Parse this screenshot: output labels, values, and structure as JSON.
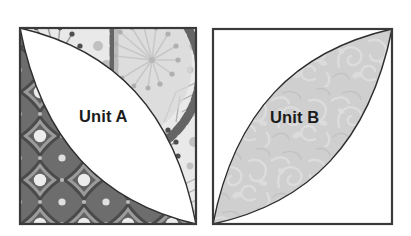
{
  "figure": {
    "type": "quilt-block-diagram",
    "background_color": "#ffffff",
    "panel_count": 2
  },
  "units": [
    {
      "id": "unit-a",
      "label": "Unit A",
      "square": {
        "x": 18,
        "y": 26,
        "width": 180,
        "height": 200
      },
      "border_color": "#3a3a3a",
      "lens": {
        "name": "center-lens",
        "orientation": "top-left-to-bottom-right",
        "fill": "#ffffff",
        "fabric": "solid-white",
        "outline_color": "#2e2e2e"
      },
      "regions": [
        {
          "name": "lower-left-region",
          "fabric": "dark-geometric-medallion-print",
          "base_color": "#7d7d7d",
          "motif_color": "#4b4b4b",
          "highlight_color": "#e8e8e8"
        },
        {
          "name": "upper-right-region",
          "fabric": "light-floral-burst-print",
          "base_color": "#e6e6e6",
          "motif_color": "#8a8a8a",
          "accent_color": "#5c5c5c"
        }
      ]
    },
    {
      "id": "unit-b",
      "label": "Unit B",
      "square": {
        "x": 211,
        "y": 27,
        "width": 183,
        "height": 199
      },
      "border_color": "#3a3a3a",
      "lens": {
        "name": "center-lens",
        "orientation": "bottom-left-to-top-right",
        "fill": "#cfcfcf",
        "fabric": "light-gray-scroll-print",
        "outline_color": "#2e2e2e"
      },
      "regions": [
        {
          "name": "upper-left-region",
          "fabric": "solid-white",
          "base_color": "#ffffff"
        },
        {
          "name": "lower-right-region",
          "fabric": "solid-white",
          "base_color": "#ffffff"
        }
      ]
    }
  ],
  "colors": {
    "page_background": "#ffffff",
    "outline": "#2e2e2e",
    "label_text": "#1b1b1b",
    "unit_b_lens_gray": "#cfcfcf",
    "unit_a_dark_print": "#6f6f6f",
    "unit_a_light_print": "#e4e4e4"
  }
}
